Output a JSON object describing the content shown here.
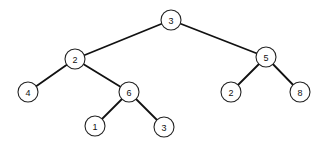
{
  "diagram": {
    "type": "binary-tree",
    "node_radius": 10,
    "colors": {
      "edge": "#111111",
      "node_stroke": "#222222",
      "node_fill": "#ffffff",
      "label": "#111111"
    },
    "nodes": [
      {
        "id": "n0",
        "label": "3",
        "x": 171,
        "y": 20
      },
      {
        "id": "n1",
        "label": "2",
        "x": 75,
        "y": 59
      },
      {
        "id": "n2",
        "label": "5",
        "x": 266,
        "y": 57
      },
      {
        "id": "n3",
        "label": "4",
        "x": 28,
        "y": 92
      },
      {
        "id": "n4",
        "label": "6",
        "x": 129,
        "y": 92
      },
      {
        "id": "n5",
        "label": "2",
        "x": 231,
        "y": 92
      },
      {
        "id": "n6",
        "label": "8",
        "x": 300,
        "y": 92
      },
      {
        "id": "n7",
        "label": "1",
        "x": 95,
        "y": 126
      },
      {
        "id": "n8",
        "label": "3",
        "x": 164,
        "y": 127
      }
    ],
    "edges": [
      {
        "from": "n0",
        "to": "n1"
      },
      {
        "from": "n0",
        "to": "n2"
      },
      {
        "from": "n1",
        "to": "n3"
      },
      {
        "from": "n1",
        "to": "n4"
      },
      {
        "from": "n2",
        "to": "n5"
      },
      {
        "from": "n2",
        "to": "n6"
      },
      {
        "from": "n4",
        "to": "n7"
      },
      {
        "from": "n4",
        "to": "n8"
      }
    ]
  }
}
